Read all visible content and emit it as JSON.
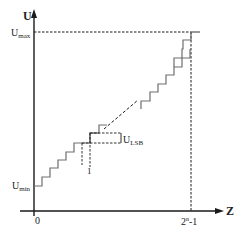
{
  "diagram": {
    "axes": {
      "y_label": "U",
      "x_label": "Z",
      "origin_label": "0",
      "x_max_label_base": "2",
      "x_max_label_sup": "n",
      "x_max_label_suffix": "-1"
    },
    "levels": {
      "u_max_base": "U",
      "u_max_sub": "max",
      "u_min_base": "U",
      "u_min_sub": "min",
      "u_lsb_base": "U",
      "u_lsb_sub": "LSB"
    },
    "annotations": {
      "step_width_label": "1"
    },
    "colors": {
      "axis": "#1a1a1a",
      "staircase": "#6e6e6e",
      "dashed": "#1a1a1a",
      "text": "#222222"
    }
  }
}
